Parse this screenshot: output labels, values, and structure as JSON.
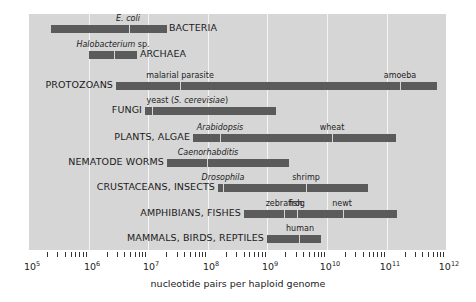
{
  "chart_data": {
    "type": "bar",
    "subtype": "horizontal-range (log scale)",
    "title": "",
    "xlabel": "nucleotide pairs per haploid genome",
    "ylabel": "",
    "xscale": "log",
    "xlim": [
      100000,
      1000000000000
    ],
    "x_ticks": [
      "10^5",
      "10^6",
      "10^7",
      "10^8",
      "10^9",
      "10^10",
      "10^11",
      "10^12"
    ],
    "grid": true,
    "legend": null,
    "categories": [
      "BACTERIA",
      "ARCHAEA",
      "PROTOZOANS",
      "FUNGI",
      "PLANTS, ALGAE",
      "NEMATODE WORMS",
      "CRUSTACEANS, INSECTS",
      "AMPHIBIANS, FISHES",
      "MAMMALS, BIRDS, REPTILES"
    ],
    "ranges": [
      {
        "group": "BACTERIA",
        "min": 230000,
        "max": 20000000,
        "markers": [
          {
            "label": "E. coli",
            "italic": true,
            "value": 4600000
          }
        ]
      },
      {
        "group": "ARCHAEA",
        "min": 1000000,
        "max": 6500000,
        "markers": [
          {
            "label": "Halobacterium sp.",
            "italic": true,
            "value": 2600000
          }
        ]
      },
      {
        "group": "PROTOZOANS",
        "min": 2900000,
        "max": 700000000000,
        "markers": [
          {
            "label": "malarial parasite",
            "italic": false,
            "value": 34000000
          },
          {
            "label": "amoeba",
            "italic": false,
            "value": 170000000000
          }
        ]
      },
      {
        "group": "FUNGI",
        "min": 9000000,
        "max": 1400000000,
        "markers": [
          {
            "label": "yeast (S. cerevisiae)",
            "italic": true,
            "value": 12000000
          }
        ]
      },
      {
        "group": "PLANTS, ALGAE",
        "min": 56000000,
        "max": 140000000000,
        "markers": [
          {
            "label": "Arabidopsis",
            "italic": true,
            "value": 160000000
          },
          {
            "label": "wheat",
            "italic": false,
            "value": 12000000000
          }
        ]
      },
      {
        "group": "NEMATODE WORMS",
        "min": 21000000,
        "max": 2300000000,
        "markers": [
          {
            "label": "Caenorhabditis",
            "italic": true,
            "value": 100000000
          }
        ]
      },
      {
        "group": "CRUSTACEANS, INSECTS",
        "min": 150000000,
        "max": 49000000000,
        "markers": [
          {
            "label": "Drosophila",
            "italic": true,
            "value": 180000000
          },
          {
            "label": "shrimp",
            "italic": false,
            "value": 4500000000
          }
        ]
      },
      {
        "group": "AMPHIBIANS, FISHES",
        "min": 400000000,
        "max": 150000000000,
        "markers": [
          {
            "label": "zebrafish",
            "italic": false,
            "value": 1900000000
          },
          {
            "label": "frog",
            "italic": false,
            "value": 3100000000
          },
          {
            "label": "newt",
            "italic": false,
            "value": 18000000000
          }
        ]
      },
      {
        "group": "MAMMALS, BIRDS, REPTILES",
        "min": 1000000000,
        "max": 8000000000,
        "markers": [
          {
            "label": "human",
            "italic": false,
            "value": 3500000000
          }
        ]
      }
    ]
  },
  "colors": {
    "plot_background": "#d6d6d6",
    "gridline": "#f4f4f4",
    "bar": "#5b5b5b",
    "text": "#1a1a1a"
  },
  "axis": {
    "xlabel": "nucleotide pairs per haploid genome",
    "tick_labels": [
      {
        "base": "10",
        "exp": "5"
      },
      {
        "base": "10",
        "exp": "6"
      },
      {
        "base": "10",
        "exp": "7"
      },
      {
        "base": "10",
        "exp": "8"
      },
      {
        "base": "10",
        "exp": "9"
      },
      {
        "base": "10",
        "exp": "10"
      },
      {
        "base": "10",
        "exp": "11"
      },
      {
        "base": "10",
        "exp": "12"
      }
    ]
  }
}
